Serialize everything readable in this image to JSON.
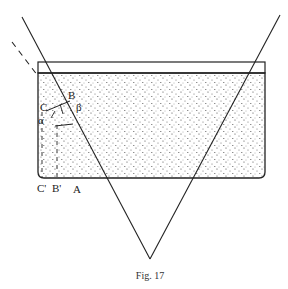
{
  "figure": {
    "caption": "Fig. 17",
    "labels": {
      "C": "C",
      "B": "B",
      "alpha": "α",
      "beta": "β",
      "C_prime": "C'",
      "B_prime": "B'",
      "A": "A"
    },
    "colors": {
      "ink": "#222222",
      "background": "#ffffff"
    }
  }
}
